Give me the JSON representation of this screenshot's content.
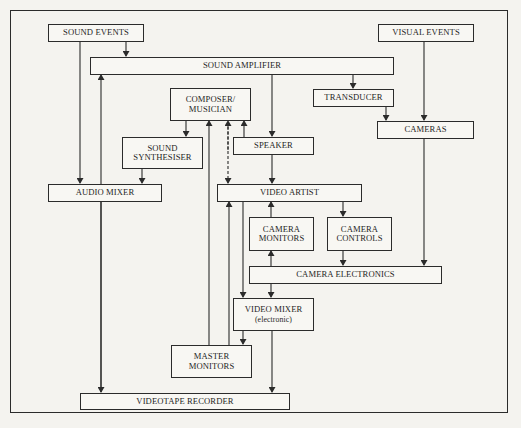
{
  "diagram": {
    "type": "flowchart",
    "colors": {
      "background": "#f4f3ef",
      "line": "#2b2b2b",
      "box_fill": "#f8f7f3",
      "text": "#1f1f1f"
    },
    "nodes": {
      "sound_events": {
        "label": "SOUND EVENTS"
      },
      "visual_events": {
        "label": "VISUAL EVENTS"
      },
      "sound_amplifier": {
        "label": "SOUND AMPLIFIER"
      },
      "composer_musician": {
        "line1": "COMPOSER/",
        "line2": "MUSICIAN"
      },
      "transducer": {
        "label": "TRANSDUCER"
      },
      "cameras": {
        "label": "CAMERAS"
      },
      "sound_synthesiser": {
        "line1": "SOUND",
        "line2": "SYNTHESISER"
      },
      "speaker": {
        "label": "SPEAKER"
      },
      "audio_mixer": {
        "label": "AUDIO MIXER"
      },
      "video_artist": {
        "label": "VIDEO ARTIST"
      },
      "camera_monitors": {
        "line1": "CAMERA",
        "line2": "MONITORS"
      },
      "camera_controls": {
        "line1": "CAMERA",
        "line2": "CONTROLS"
      },
      "camera_electronics": {
        "label": "CAMERA ELECTRONICS"
      },
      "video_mixer": {
        "line1": "VIDEO MIXER",
        "line2": "(electronic)"
      },
      "master_monitors": {
        "line1": "MASTER",
        "line2": "MONITORS"
      },
      "videotape_recorder": {
        "label": "VIDEOTAPE RECORDER"
      }
    },
    "edges": [
      {
        "from": "SOUND EVENTS",
        "to": "SOUND AMPLIFIER"
      },
      {
        "from": "SOUND EVENTS",
        "to": "AUDIO MIXER"
      },
      {
        "from": "AUDIO MIXER",
        "to": "SOUND AMPLIFIER"
      },
      {
        "from": "AUDIO MIXER",
        "to": "VIDEOTAPE RECORDER"
      },
      {
        "from": "SOUND AMPLIFIER",
        "to": "SPEAKER"
      },
      {
        "from": "SOUND AMPLIFIER",
        "to": "TRANSDUCER"
      },
      {
        "from": "TRANSDUCER",
        "to": "CAMERAS"
      },
      {
        "from": "VISUAL EVENTS",
        "to": "CAMERAS"
      },
      {
        "from": "CAMERAS",
        "to": "CAMERA ELECTRONICS"
      },
      {
        "from": "COMPOSER/MUSICIAN",
        "to": "SOUND SYNTHESISER"
      },
      {
        "from": "SOUND SYNTHESISER",
        "to": "AUDIO MIXER"
      },
      {
        "from": "SPEAKER",
        "to": "COMPOSER/MUSICIAN"
      },
      {
        "from": "SPEAKER",
        "to": "VIDEO ARTIST"
      },
      {
        "from": "COMPOSER/MUSICIAN",
        "to": "VIDEO ARTIST",
        "style": "dashed",
        "bidirectional": true
      },
      {
        "from": "MASTER MONITORS",
        "to": "COMPOSER/MUSICIAN"
      },
      {
        "from": "MASTER MONITORS",
        "to": "VIDEO ARTIST"
      },
      {
        "from": "VIDEO ARTIST",
        "to": "CAMERA CONTROLS"
      },
      {
        "from": "VIDEO ARTIST",
        "to": "VIDEO MIXER (electronic)"
      },
      {
        "from": "CAMERA MONITORS",
        "to": "VIDEO ARTIST"
      },
      {
        "from": "CAMERA ELECTRONICS",
        "to": "CAMERA MONITORS"
      },
      {
        "from": "CAMERA CONTROLS",
        "to": "CAMERA ELECTRONICS"
      },
      {
        "from": "CAMERA ELECTRONICS",
        "to": "VIDEO MIXER (electronic)"
      },
      {
        "from": "VIDEO MIXER (electronic)",
        "to": "MASTER MONITORS"
      },
      {
        "from": "VIDEO MIXER (electronic)",
        "to": "VIDEOTAPE RECORDER"
      }
    ]
  }
}
